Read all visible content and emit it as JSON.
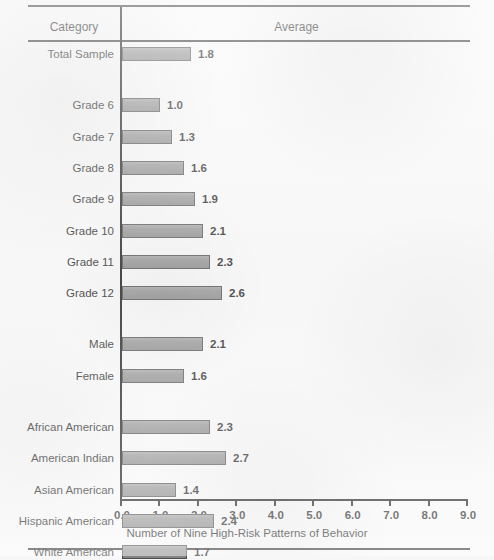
{
  "figure": {
    "columns": {
      "category_header": "Category",
      "average_header": "Average"
    },
    "axis_title": "Number of Nine High-Risk Patterns of Behavior"
  },
  "chart_data": {
    "type": "bar",
    "orientation": "horizontal",
    "title": "",
    "xlabel": "Number of Nine High-Risk Patterns of Behavior",
    "ylabel": "Category",
    "xlim": [
      0.0,
      9.0
    ],
    "xticks": [
      "0.0",
      "1.0",
      "2.0",
      "3.0",
      "4.0",
      "5.0",
      "6.0",
      "7.0",
      "8.0",
      "9.0"
    ],
    "grid": false,
    "legend": false,
    "bar_color": "#8c8c8c",
    "bar_edge_color": "#4a4a4a",
    "groups": [
      {
        "name": "total",
        "categories": [
          "Total Sample"
        ],
        "values": [
          1.8
        ],
        "labels": [
          "1.8"
        ]
      },
      {
        "name": "grade",
        "categories": [
          "Grade 6",
          "Grade 7",
          "Grade 8",
          "Grade 9",
          "Grade 10",
          "Grade 11",
          "Grade 12"
        ],
        "values": [
          1.0,
          1.3,
          1.6,
          1.9,
          2.1,
          2.3,
          2.6
        ],
        "labels": [
          "1.0",
          "1.3",
          "1.6",
          "1.9",
          "2.1",
          "2.3",
          "2.6"
        ]
      },
      {
        "name": "gender",
        "categories": [
          "Male",
          "Female"
        ],
        "values": [
          2.1,
          1.6
        ],
        "labels": [
          "2.1",
          "1.6"
        ]
      },
      {
        "name": "ethnicity",
        "categories": [
          "African American",
          "American Indian",
          "Asian American",
          "Hispanic American",
          "White American"
        ],
        "values": [
          2.3,
          2.7,
          1.4,
          2.4,
          1.7
        ],
        "labels": [
          "2.3",
          "2.7",
          "1.4",
          "2.4",
          "1.7"
        ]
      }
    ],
    "categories": [
      "Total Sample",
      "Grade 6",
      "Grade 7",
      "Grade 8",
      "Grade 9",
      "Grade 10",
      "Grade 11",
      "Grade 12",
      "Male",
      "Female",
      "African American",
      "American Indian",
      "Asian American",
      "Hispanic American",
      "White American"
    ],
    "values": [
      1.8,
      1.0,
      1.3,
      1.6,
      1.9,
      2.1,
      2.3,
      2.6,
      2.1,
      1.6,
      2.3,
      2.7,
      1.4,
      2.4,
      1.7
    ]
  }
}
